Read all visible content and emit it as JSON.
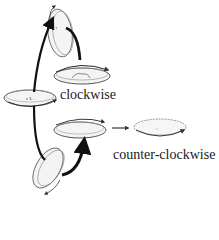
{
  "diagram": {
    "labels": {
      "clockwise": "clockwise",
      "counter_clockwise": "counter-clockwise"
    },
    "nodes": [
      {
        "id": "top-tilted-disc",
        "orientation": "vertical-tilted"
      },
      {
        "id": "clockwise-disc",
        "orientation": "horizontal",
        "rotation": "clockwise"
      },
      {
        "id": "left-flat-disc",
        "orientation": "horizontal"
      },
      {
        "id": "middle-flat-disc",
        "orientation": "horizontal"
      },
      {
        "id": "bottom-tilted-disc",
        "orientation": "vertical-tilted"
      },
      {
        "id": "counter-clockwise-disc",
        "orientation": "horizontal",
        "rotation": "counter-clockwise"
      }
    ],
    "colors": {
      "stroke": "#222222",
      "disc_fill": "#f4f4f4",
      "arrow": "#111111"
    }
  }
}
